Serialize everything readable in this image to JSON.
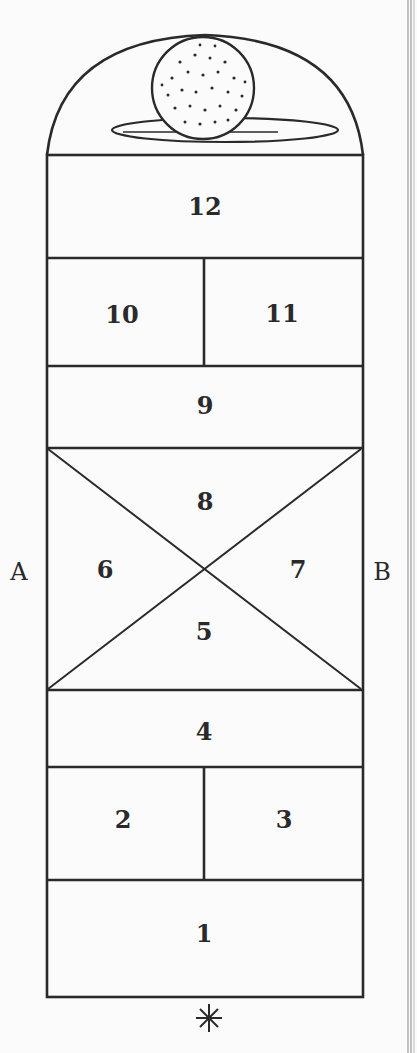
{
  "diagram": {
    "type": "hopscotch court",
    "squares": [
      {
        "label": "1"
      },
      {
        "label": "2"
      },
      {
        "label": "3"
      },
      {
        "label": "4"
      },
      {
        "label": "5"
      },
      {
        "label": "6"
      },
      {
        "label": "7"
      },
      {
        "label": "8"
      },
      {
        "label": "9"
      },
      {
        "label": "10"
      },
      {
        "label": "11"
      },
      {
        "label": "12"
      }
    ],
    "side_labels": {
      "left": "A",
      "right": "B"
    },
    "start_marker": "✱",
    "top_element": "dotted ball resting on oval rest inside dome"
  },
  "colors": {
    "line": "#2a2a2a",
    "background": "#fbfbfb"
  }
}
